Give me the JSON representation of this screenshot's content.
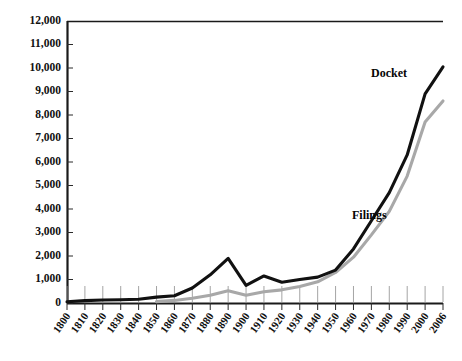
{
  "chart_data": {
    "type": "line",
    "title": "",
    "xlabel": "",
    "ylabel": "",
    "xlim": [
      1800,
      2006
    ],
    "ylim": [
      0,
      12000
    ],
    "grid": false,
    "legend_position": "inline-right",
    "x": [
      1800,
      1810,
      1820,
      1830,
      1840,
      1850,
      1860,
      1870,
      1880,
      1890,
      1900,
      1910,
      1920,
      1930,
      1940,
      1950,
      1960,
      1970,
      1980,
      1990,
      2000,
      2006
    ],
    "xtick_labels": [
      "1800",
      "1810",
      "1820",
      "1830",
      "1840",
      "1850",
      "1860",
      "1870",
      "1880",
      "1890",
      "1900",
      "1910",
      "1920",
      "1930",
      "1940",
      "1950",
      "1960",
      "1970",
      "1980",
      "1990",
      "2000",
      "2006"
    ],
    "ytick_labels": [
      "0",
      "1,000",
      "2,000",
      "3,000",
      "4,000",
      "5,000",
      "6,000",
      "7,000",
      "8,000",
      "9,000",
      "10,000",
      "11,000",
      "12,000"
    ],
    "ytick_values": [
      0,
      1000,
      2000,
      3000,
      4000,
      5000,
      6000,
      7000,
      8000,
      9000,
      10000,
      11000,
      12000
    ],
    "series": [
      {
        "name": "Docket",
        "color": "#111111",
        "label": "Docket",
        "values": [
          50,
          100,
          130,
          140,
          160,
          250,
          310,
          640,
          1200,
          1900,
          750,
          1150,
          880,
          1000,
          1100,
          1400,
          2300,
          3500,
          4700,
          6300,
          8900,
          10050
        ]
      },
      {
        "name": "Filings",
        "color": "#a8a8a8",
        "label": "Filings",
        "values": [
          null,
          null,
          null,
          null,
          null,
          60,
          110,
          200,
          330,
          520,
          330,
          480,
          560,
          700,
          900,
          1300,
          1950,
          2900,
          3900,
          5400,
          7700,
          8600
        ]
      }
    ],
    "annotations": [
      {
        "text": "Docket",
        "x": 1990,
        "y": 9600
      },
      {
        "text": "Filings",
        "x": 1978,
        "y": 4500
      }
    ]
  }
}
